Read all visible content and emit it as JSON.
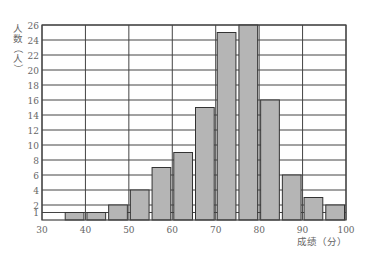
{
  "chart_data": {
    "type": "bar",
    "subtype": "histogram",
    "title": "",
    "xlabel": "成绩（分）",
    "ylabel": "人数（人）",
    "bin_edges": [
      35,
      40,
      45,
      50,
      55,
      60,
      65,
      70,
      75,
      80,
      85,
      90,
      95,
      100
    ],
    "categories": [
      "35-40",
      "40-45",
      "45-50",
      "50-55",
      "55-60",
      "60-65",
      "65-70",
      "70-75",
      "75-80",
      "80-85",
      "85-90",
      "90-95",
      "95-100"
    ],
    "values": [
      1,
      1,
      2,
      4,
      7,
      9,
      15,
      25,
      26,
      16,
      6,
      3,
      2
    ],
    "xlim": [
      30,
      100
    ],
    "ylim": [
      0,
      26
    ],
    "x_ticks": [
      30,
      40,
      50,
      60,
      70,
      80,
      90,
      100
    ],
    "y_ticks": [
      1,
      2,
      4,
      6,
      8,
      10,
      12,
      14,
      16,
      18,
      20,
      22,
      24,
      26
    ],
    "grid": true,
    "legend": null,
    "bar_color": "#b5b5b5",
    "edge_color": "#333333",
    "grid_color": "#444444"
  },
  "labels": {
    "ylabel_chars": [
      "人",
      "数",
      "（",
      "人",
      "）"
    ],
    "xlabel": "成绩（分）"
  }
}
